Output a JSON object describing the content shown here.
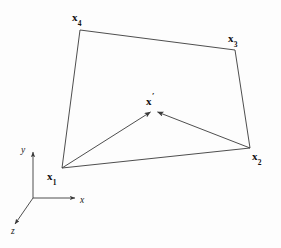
{
  "figure": {
    "background_color": "#fdfdfd",
    "stroke_color": "#3a3a3a",
    "text_color": "#111111",
    "width": 281,
    "height": 248
  },
  "vertices": {
    "x1": {
      "label_main": "x",
      "label_sub": "1",
      "point": [
        62,
        168
      ],
      "label_pos": [
        47,
        172
      ]
    },
    "x2": {
      "label_main": "x",
      "label_sub": "2",
      "point": [
        250,
        148
      ],
      "label_pos": [
        252,
        152
      ]
    },
    "x3": {
      "label_main": "x",
      "label_sub": "3",
      "point": [
        235,
        50
      ],
      "label_pos": [
        227,
        33
      ]
    },
    "x4": {
      "label_main": "x",
      "label_sub": "4",
      "point": [
        80,
        30
      ],
      "label_pos": [
        71,
        12
      ]
    },
    "xprime": {
      "label_main": "x",
      "label_prime": "′",
      "point": [
        153,
        110
      ],
      "label_pos": [
        145,
        92
      ]
    }
  },
  "quad_edges": [
    {
      "name": "edge-x4-x3",
      "from": [
        80,
        30
      ],
      "to": [
        235,
        50
      ]
    },
    {
      "name": "edge-x3-x2",
      "from": [
        235,
        50
      ],
      "to": [
        250,
        148
      ]
    },
    {
      "name": "edge-x2-x1",
      "from": [
        250,
        148
      ],
      "to": [
        62,
        168
      ]
    },
    {
      "name": "edge-x1-x4",
      "from": [
        62,
        168
      ],
      "to": [
        80,
        30
      ]
    }
  ],
  "arrows": [
    {
      "name": "arrow-x1-to-xprime",
      "from": [
        62,
        168
      ],
      "to": [
        152,
        111
      ]
    },
    {
      "name": "arrow-x2-to-xprime",
      "from": [
        250,
        148
      ],
      "to": [
        156,
        111
      ]
    }
  ],
  "axes": {
    "origin": [
      33,
      198
    ],
    "x_axis": {
      "label": "x",
      "tip": [
        78,
        198
      ],
      "label_pos": [
        80,
        197
      ]
    },
    "y_axis": {
      "label": "y",
      "tip": [
        33,
        149
      ],
      "label_pos": [
        21,
        146
      ]
    },
    "z_axis": {
      "label": "z",
      "tip": [
        12,
        227
      ],
      "label_pos": [
        11,
        228
      ]
    }
  }
}
